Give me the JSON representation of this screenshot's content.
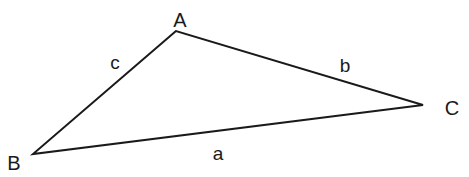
{
  "diagram": {
    "type": "triangle",
    "vertices": [
      {
        "id": "A",
        "label": "A",
        "x": 176,
        "y": 31,
        "label_x": 180,
        "label_y": 27
      },
      {
        "id": "B",
        "label": "B",
        "x": 33,
        "y": 154,
        "label_x": 14,
        "label_y": 170
      },
      {
        "id": "C",
        "label": "C",
        "x": 423,
        "y": 105,
        "label_x": 452,
        "label_y": 115
      }
    ],
    "sides": [
      {
        "id": "a",
        "label": "a",
        "from": "B",
        "to": "C",
        "label_x": 218,
        "label_y": 160
      },
      {
        "id": "b",
        "label": "b",
        "from": "A",
        "to": "C",
        "label_x": 345,
        "label_y": 72
      },
      {
        "id": "c",
        "label": "c",
        "from": "B",
        "to": "A",
        "label_x": 115,
        "label_y": 69
      }
    ],
    "stroke_color": "#1a1a1a"
  }
}
